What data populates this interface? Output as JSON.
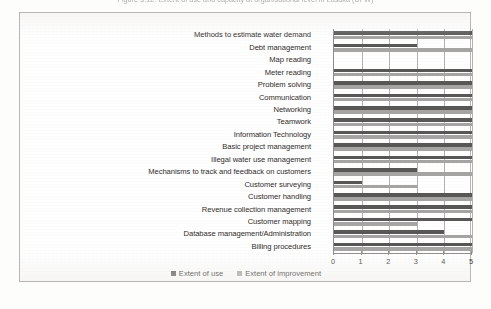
{
  "caption": {
    "text": "Figure 5.12: Extent of use and capacity at organisational level in Lusaka (UFW)"
  },
  "legend": {
    "items": [
      {
        "label": "Extent of use",
        "color": "#595856",
        "key": "use"
      },
      {
        "label": "Extent of improvement",
        "color": "#a6a5a3",
        "key": "imp"
      }
    ]
  },
  "axis": {
    "ticks": [
      "0",
      "1",
      "2",
      "3",
      "4",
      "5"
    ]
  },
  "chart_data": {
    "type": "bar",
    "orientation": "horizontal",
    "grouped": true,
    "title": "Extent of use and capacity at organisational level in Lusaka (UFW)",
    "xlabel": "",
    "ylabel": "",
    "xlim": [
      0,
      5
    ],
    "xticks": [
      0,
      1,
      2,
      3,
      4,
      5
    ],
    "grid": true,
    "grid_axis": "x",
    "legend_position": "bottom",
    "categories": [
      "Methods to estimate water demand",
      "Debt management",
      "Map reading",
      "Meter reading",
      "Problem solving",
      "Communication",
      "Networking",
      "Teamwork",
      "Information Technology",
      "Basic project management",
      "Illegal water use management",
      "Mechanisms to track and feedback on customers",
      "Customer surveying",
      "Customer handling",
      "Revenue collection management",
      "Customer mapping",
      "Database management/Administration",
      "Billing procedures"
    ],
    "series": [
      {
        "name": "Extent of use",
        "color": "#595856",
        "values": [
          5,
          3,
          0,
          5,
          5,
          5,
          5,
          5,
          5,
          5,
          5,
          3,
          1,
          5,
          5,
          5,
          4,
          5
        ]
      },
      {
        "name": "Extent of improvement",
        "color": "#a6a5a3",
        "values": [
          5,
          5,
          0,
          5,
          5,
          5,
          5,
          5,
          5,
          5,
          5,
          5,
          3,
          5,
          5,
          3,
          5,
          5
        ]
      }
    ]
  }
}
